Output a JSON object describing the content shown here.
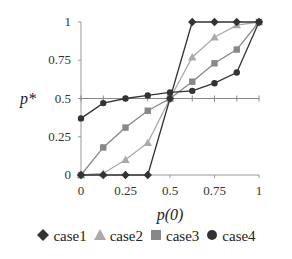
{
  "chart_data": {
    "type": "line",
    "title": "",
    "xlabel": "p(0)",
    "ylabel": "p*",
    "xlim": [
      0,
      1
    ],
    "ylim": [
      0,
      1
    ],
    "grid": false,
    "legend_position": "bottom",
    "x_ticks": [
      "0",
      "0.25",
      "0.5",
      "0.75",
      "1"
    ],
    "y_ticks": [
      "0",
      "0.25",
      "0.5",
      "0.75",
      "1"
    ],
    "x": [
      0,
      0.125,
      0.25,
      0.375,
      0.5,
      0.625,
      0.75,
      0.875,
      1
    ],
    "reference_line": {
      "y": 0.5,
      "color": "#888888",
      "marker": "plus"
    },
    "series": [
      {
        "name": "case1",
        "marker": "diamond",
        "color": "#333333",
        "values": [
          0,
          0,
          0,
          0,
          0.5,
          1,
          1,
          1,
          1
        ]
      },
      {
        "name": "case2",
        "marker": "triangle",
        "color": "#aaaaaa",
        "values": [
          0,
          0.01,
          0.1,
          0.21,
          0.5,
          0.77,
          0.9,
          0.98,
          1
        ]
      },
      {
        "name": "case3",
        "marker": "square",
        "color": "#888888",
        "values": [
          0,
          0.18,
          0.31,
          0.42,
          0.5,
          0.61,
          0.73,
          0.82,
          1
        ]
      },
      {
        "name": "case4",
        "marker": "circle",
        "color": "#333333",
        "values": [
          0.37,
          0.47,
          0.5,
          0.52,
          0.54,
          0.55,
          0.6,
          0.67,
          1
        ]
      }
    ]
  }
}
